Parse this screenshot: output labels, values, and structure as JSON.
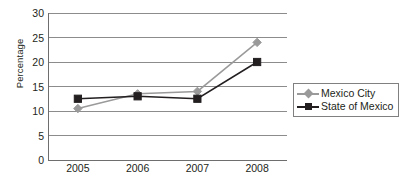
{
  "chart_data": {
    "type": "line",
    "title": "",
    "xlabel": "",
    "ylabel": "Percentage",
    "categories": [
      "2005",
      "2006",
      "2007",
      "2008"
    ],
    "yticks": [
      0,
      5,
      10,
      15,
      20,
      25,
      30
    ],
    "ylim": [
      0,
      30
    ],
    "grid": "horizontal",
    "legend_position": "right",
    "series": [
      {
        "name": "Mexico City",
        "marker": "diamond",
        "color": "#9a9a9a",
        "values": [
          10.5,
          13.5,
          14,
          24
        ]
      },
      {
        "name": "State of Mexico",
        "marker": "square",
        "color": "#231f20",
        "values": [
          12.5,
          13,
          12.5,
          20
        ]
      }
    ]
  },
  "axis": {
    "y_title": "Percentage"
  },
  "legend": {
    "items": [
      {
        "label": "Mexico City"
      },
      {
        "label": "State of Mexico"
      }
    ]
  },
  "colors": {
    "series_1": "#9a9a9a",
    "series_2": "#231f20",
    "grid": "#8c8c8c",
    "axis": "#6e6e6e",
    "text": "#231f20"
  }
}
